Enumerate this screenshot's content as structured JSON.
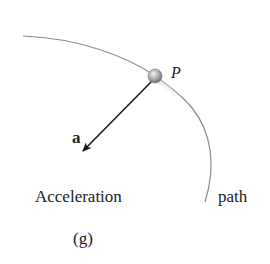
{
  "diagram": {
    "point_label": "P",
    "vector_label": "a",
    "caption": "Acceleration",
    "path_label": "path",
    "figure_tag": "(g)",
    "colors": {
      "path_curve": "#8a8a8a",
      "vector": "#1a1a1a",
      "particle": "#b0b0b0",
      "text": "#222222"
    }
  }
}
